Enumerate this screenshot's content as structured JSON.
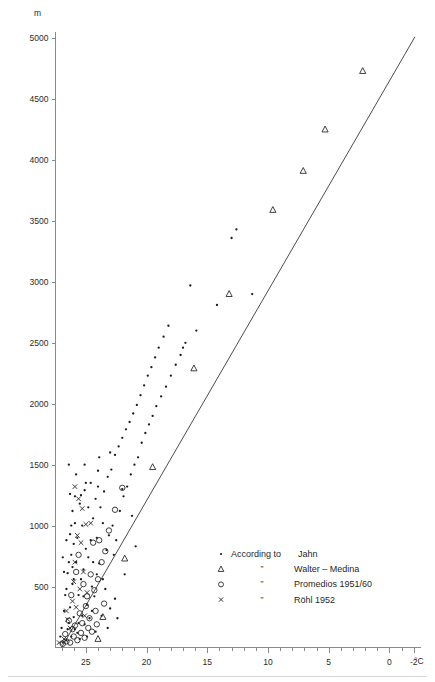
{
  "chart_data": {
    "type": "scatter",
    "title": "",
    "xlabel": "",
    "ylabel": "",
    "y_unit": "m",
    "x_unit": "°C",
    "xlim": [
      27.5,
      -2.6
    ],
    "ylim": [
      0,
      5050
    ],
    "x_reversed": true,
    "grid": false,
    "legend_position": "inside-lower-right",
    "y_ticks": [
      500,
      1000,
      1500,
      2000,
      2500,
      3000,
      3500,
      4000,
      4500,
      5000
    ],
    "y_tick_labels": [
      "500",
      "1000",
      "1500",
      "2000",
      "2500",
      "3000",
      "3500",
      "4000",
      "4500",
      "5000"
    ],
    "x_ticks": [
      25,
      20,
      15,
      10,
      5,
      0,
      -2
    ],
    "x_tick_labels": [
      "25",
      "20",
      "15",
      "10",
      "5",
      "0",
      "-2"
    ],
    "x_minor_step": 1,
    "trendline": {
      "x0": 27.0,
      "y0": 0,
      "x1": -2.1,
      "y1": 5010
    },
    "series": [
      {
        "name": "According to Jahn",
        "marker": "dot",
        "points": [
          [
            26.6,
            60
          ],
          [
            26.2,
            90
          ],
          [
            26.9,
            40
          ],
          [
            25.9,
            150
          ],
          [
            26.4,
            200
          ],
          [
            26.0,
            250
          ],
          [
            25.7,
            120
          ],
          [
            26.3,
            330
          ],
          [
            25.5,
            70
          ],
          [
            26.7,
            430
          ],
          [
            26.1,
            520
          ],
          [
            25.3,
            260
          ],
          [
            26.5,
            610
          ],
          [
            25.8,
            700
          ],
          [
            26.2,
            760
          ],
          [
            25.1,
            190
          ],
          [
            26.0,
            850
          ],
          [
            25.6,
            430
          ],
          [
            24.9,
            350
          ],
          [
            26.8,
            300
          ],
          [
            25.4,
            560
          ],
          [
            24.7,
            240
          ],
          [
            26.3,
            930
          ],
          [
            25.9,
            1020
          ],
          [
            25.2,
            640
          ],
          [
            24.5,
            500
          ],
          [
            26.1,
            1120
          ],
          [
            25.0,
            810
          ],
          [
            24.3,
            420
          ],
          [
            25.7,
            900
          ],
          [
            24.1,
            600
          ],
          [
            25.5,
            1180
          ],
          [
            24.8,
            740
          ],
          [
            23.9,
            690
          ],
          [
            25.3,
            1000
          ],
          [
            23.6,
            560
          ],
          [
            24.6,
            880
          ],
          [
            25.1,
            1290
          ],
          [
            23.3,
            800
          ],
          [
            24.4,
            1060
          ],
          [
            26.6,
            480
          ],
          [
            27.0,
            160
          ],
          [
            26.4,
            700
          ],
          [
            23.1,
            920
          ],
          [
            24.2,
            1220
          ],
          [
            22.8,
            1000
          ],
          [
            23.8,
            1150
          ],
          [
            24.0,
            1320
          ],
          [
            22.5,
            880
          ],
          [
            23.5,
            1280
          ],
          [
            22.2,
            1120
          ],
          [
            23.2,
            1400
          ],
          [
            21.9,
            1240
          ],
          [
            22.9,
            1460
          ],
          [
            21.6,
            1320
          ],
          [
            22.6,
            1580
          ],
          [
            21.3,
            1420
          ],
          [
            22.3,
            1650
          ],
          [
            21.0,
            1500
          ],
          [
            22.0,
            1720
          ],
          [
            20.7,
            1560
          ],
          [
            21.7,
            1790
          ],
          [
            20.4,
            1680
          ],
          [
            21.4,
            1850
          ],
          [
            20.1,
            1760
          ],
          [
            21.1,
            1920
          ],
          [
            19.8,
            1830
          ],
          [
            20.8,
            1990
          ],
          [
            19.5,
            1900
          ],
          [
            20.5,
            2070
          ],
          [
            19.2,
            1980
          ],
          [
            20.2,
            2150
          ],
          [
            18.8,
            2060
          ],
          [
            19.9,
            2230
          ],
          [
            18.4,
            2140
          ],
          [
            19.6,
            2300
          ],
          [
            18.0,
            2230
          ],
          [
            19.3,
            2380
          ],
          [
            17.6,
            2320
          ],
          [
            19.0,
            2460
          ],
          [
            17.2,
            2400
          ],
          [
            18.6,
            2550
          ],
          [
            16.8,
            2500
          ],
          [
            18.2,
            2640
          ],
          [
            16.4,
            2970
          ],
          [
            17.0,
            2460
          ],
          [
            15.9,
            2600
          ],
          [
            14.2,
            2810
          ],
          [
            13.0,
            3360
          ],
          [
            12.6,
            3430
          ],
          [
            11.3,
            2900
          ],
          [
            23.0,
            1600
          ],
          [
            24.0,
            1450
          ],
          [
            25.0,
            1350
          ],
          [
            22.0,
            1300
          ],
          [
            26.2,
            1000
          ],
          [
            25.4,
            1250
          ],
          [
            24.4,
            700
          ],
          [
            23.4,
            480
          ],
          [
            26.8,
            620
          ],
          [
            27.1,
            90
          ],
          [
            26.5,
            150
          ],
          [
            25.6,
            200
          ],
          [
            24.9,
            90
          ],
          [
            24.2,
            130
          ],
          [
            23.7,
            260
          ],
          [
            23.0,
            320
          ],
          [
            22.4,
            240
          ],
          [
            26.9,
            740
          ],
          [
            26.3,
            1260
          ],
          [
            25.8,
            1420
          ],
          [
            25.1,
            1500
          ],
          [
            24.6,
            1350
          ],
          [
            23.9,
            1560
          ],
          [
            26.0,
            560
          ],
          [
            24.5,
            300
          ],
          [
            23.2,
            160
          ],
          [
            22.6,
            400
          ],
          [
            21.8,
            600
          ],
          [
            20.9,
            830
          ],
          [
            26.6,
            880
          ],
          [
            26.1,
            660
          ],
          [
            25.2,
            420
          ],
          [
            24.8,
            1150
          ],
          [
            24.1,
            900
          ],
          [
            23.6,
            1020
          ],
          [
            22.7,
            760
          ],
          [
            21.2,
            1080
          ],
          [
            26.4,
            1500
          ],
          [
            25.9,
            1240
          ]
        ]
      },
      {
        "name": "Walter – Medina",
        "marker": "triangle",
        "points": [
          [
            24.0,
            70
          ],
          [
            23.6,
            250
          ],
          [
            21.8,
            730
          ],
          [
            19.5,
            1480
          ],
          [
            16.1,
            2290
          ],
          [
            13.2,
            2900
          ],
          [
            9.6,
            3590
          ],
          [
            7.1,
            3910
          ],
          [
            5.3,
            4250
          ],
          [
            2.2,
            4730
          ]
        ]
      },
      {
        "name": "Promedios 1951/60",
        "marker": "circle",
        "points": [
          [
            26.9,
            30
          ],
          [
            26.6,
            50
          ],
          [
            26.3,
            40
          ],
          [
            26.0,
            90
          ],
          [
            25.7,
            60
          ],
          [
            25.4,
            120
          ],
          [
            25.1,
            80
          ],
          [
            24.8,
            160
          ],
          [
            25.9,
            180
          ],
          [
            26.4,
            220
          ],
          [
            24.5,
            130
          ],
          [
            24.2,
            300
          ],
          [
            25.0,
            340
          ],
          [
            25.5,
            280
          ],
          [
            24.9,
            420
          ],
          [
            24.3,
            470
          ],
          [
            25.2,
            520
          ],
          [
            24.6,
            600
          ],
          [
            24.0,
            560
          ],
          [
            23.7,
            700
          ],
          [
            23.4,
            790
          ],
          [
            23.9,
            880
          ],
          [
            23.1,
            960
          ],
          [
            22.6,
            1130
          ],
          [
            22.0,
            1310
          ],
          [
            26.7,
            110
          ],
          [
            26.1,
            150
          ],
          [
            25.3,
            200
          ],
          [
            24.7,
            240
          ],
          [
            24.1,
            190
          ],
          [
            23.5,
            360
          ],
          [
            26.2,
            430
          ],
          [
            25.8,
            620
          ],
          [
            25.6,
            760
          ],
          [
            24.4,
            860
          ]
        ]
      },
      {
        "name": "Röhl 1952",
        "marker": "x",
        "points": [
          [
            27.2,
            40
          ],
          [
            26.8,
            70
          ],
          [
            26.5,
            230
          ],
          [
            26.1,
            380
          ],
          [
            25.8,
            330
          ],
          [
            25.5,
            480
          ],
          [
            26.0,
            540
          ],
          [
            25.2,
            620
          ],
          [
            25.9,
            700
          ],
          [
            25.4,
            860
          ],
          [
            25.7,
            920
          ],
          [
            25.0,
            1010
          ],
          [
            25.3,
            1140
          ],
          [
            24.9,
            450
          ],
          [
            26.3,
            160
          ],
          [
            26.6,
            300
          ],
          [
            25.1,
            260
          ],
          [
            24.6,
            1020
          ],
          [
            25.6,
            1220
          ],
          [
            25.9,
            1320
          ]
        ]
      }
    ]
  },
  "legend": {
    "entries": [
      {
        "marker": "dot",
        "prefix": "According to",
        "ditto": "",
        "label": "Jahn",
        "full": "According to Jahn"
      },
      {
        "marker": "triangle",
        "prefix": "",
        "ditto": "”",
        "label": "Walter – Medina",
        "full": "Walter – Medina"
      },
      {
        "marker": "circle",
        "prefix": "",
        "ditto": "”",
        "label": "Promedios 1951/60",
        "full": "Promedios 1951/60"
      },
      {
        "marker": "x",
        "prefix": "",
        "ditto": "”",
        "label": "Röhl 1952",
        "full": "Röhl 1952"
      }
    ]
  },
  "axes": {
    "y_unit_label": "m",
    "x_unit_label": "°C"
  }
}
